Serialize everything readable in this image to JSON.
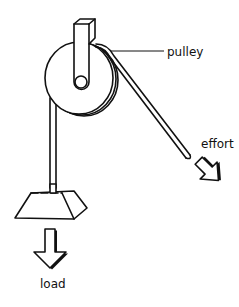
{
  "diagram": {
    "type": "labeled illustration",
    "labels": {
      "pulley": "pulley",
      "effort": "effort",
      "load": "load"
    },
    "colors": {
      "line": "#111111",
      "background": "#ffffff"
    }
  }
}
